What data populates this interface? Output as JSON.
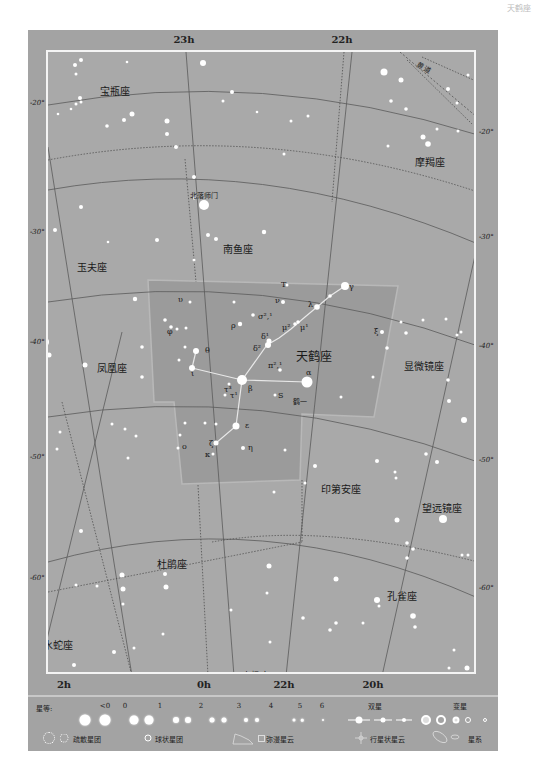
{
  "page_header": "天鹤座",
  "chart": {
    "ra_labels_top": [
      {
        "text": "23h",
        "x": 184
      },
      {
        "text": "22h",
        "x": 342
      }
    ],
    "ra_labels_bottom": [
      {
        "text": "2h",
        "x": 64
      },
      {
        "text": "0h",
        "x": 204
      },
      {
        "text": "22h",
        "x": 284
      },
      {
        "text": "20h",
        "x": 373
      }
    ],
    "dec_labels_left": [
      {
        "text": "-20°",
        "y": 104
      },
      {
        "text": "-30°",
        "y": 233
      },
      {
        "text": "-40°",
        "y": 343
      },
      {
        "text": "-50°",
        "y": 458
      },
      {
        "text": "-60°",
        "y": 579
      }
    ],
    "dec_labels_right": [
      {
        "text": "-20°",
        "y": 133
      },
      {
        "text": "-30°",
        "y": 238
      },
      {
        "text": "-40°",
        "y": 347
      },
      {
        "text": "-50°",
        "y": 461
      },
      {
        "text": "-60°",
        "y": 589
      }
    ],
    "constellations": [
      {
        "name": "宝瓶座",
        "x": 113,
        "y": 86,
        "size": 10
      },
      {
        "name": "摩羯座",
        "x": 428,
        "y": 157,
        "size": 10
      },
      {
        "name": "南鱼座",
        "x": 236,
        "y": 244,
        "size": 10
      },
      {
        "name": "玉夫座",
        "x": 90,
        "y": 262,
        "size": 10
      },
      {
        "name": "天鹤座",
        "x": 312,
        "y": 351,
        "size": 12
      },
      {
        "name": "凤凰座",
        "x": 110,
        "y": 363,
        "size": 10
      },
      {
        "name": "显微镜座",
        "x": 422,
        "y": 361,
        "size": 10
      },
      {
        "name": "印第安座",
        "x": 339,
        "y": 484,
        "size": 10
      },
      {
        "name": "望远镜座",
        "x": 440,
        "y": 503,
        "size": 10
      },
      {
        "name": "杜鹃座",
        "x": 170,
        "y": 559,
        "size": 10
      },
      {
        "name": "孔雀座",
        "x": 400,
        "y": 591,
        "size": 10
      },
      {
        "name": "水蛇座",
        "x": 56,
        "y": 640,
        "size": 10
      },
      {
        "name": "南极座",
        "x": 253,
        "y": 671,
        "size": 9
      }
    ],
    "annotations": [
      {
        "text": "黄道",
        "x": 422,
        "y": 64,
        "rotate": 30
      },
      {
        "text": "北落师门",
        "x": 202,
        "y": 192,
        "rotate": 0
      },
      {
        "text": "鹤一",
        "x": 298,
        "y": 398,
        "rotate": 0
      }
    ],
    "star_labels": [
      {
        "text": "T",
        "x": 279,
        "y": 283
      },
      {
        "text": "υ",
        "x": 176,
        "y": 298
      },
      {
        "text": "ν",
        "x": 273,
        "y": 299
      },
      {
        "text": "γ",
        "x": 347,
        "y": 285
      },
      {
        "text": "λ",
        "x": 306,
        "y": 303
      },
      {
        "text": "σ²,¹",
        "x": 256,
        "y": 315
      },
      {
        "text": "φ",
        "x": 165,
        "y": 330
      },
      {
        "text": "ρ",
        "x": 229,
        "y": 324
      },
      {
        "text": "μ²",
        "x": 280,
        "y": 326
      },
      {
        "text": "μ¹",
        "x": 298,
        "y": 326
      },
      {
        "text": "ξ",
        "x": 372,
        "y": 330
      },
      {
        "text": "δ¹",
        "x": 259,
        "y": 335
      },
      {
        "text": "δ²",
        "x": 251,
        "y": 347
      },
      {
        "text": "θ",
        "x": 203,
        "y": 349
      },
      {
        "text": "π²,¹",
        "x": 266,
        "y": 364
      },
      {
        "text": "ι",
        "x": 189,
        "y": 372
      },
      {
        "text": "α",
        "x": 304,
        "y": 371
      },
      {
        "text": "β",
        "x": 246,
        "y": 387
      },
      {
        "text": "τ³",
        "x": 222,
        "y": 388
      },
      {
        "text": "τ¹",
        "x": 228,
        "y": 394
      },
      {
        "text": "S",
        "x": 276,
        "y": 394
      },
      {
        "text": "ε",
        "x": 243,
        "y": 424
      },
      {
        "text": "ζ",
        "x": 207,
        "y": 442
      },
      {
        "text": "ο",
        "x": 180,
        "y": 445
      },
      {
        "text": "η",
        "x": 246,
        "y": 446
      },
      {
        "text": "κ",
        "x": 203,
        "y": 453
      }
    ]
  },
  "legend": {
    "magnitude_label": "星等:",
    "magnitudes": [
      {
        "label": "<0",
        "x": 105
      },
      {
        "label": "0",
        "x": 125
      },
      {
        "label": "1",
        "x": 160
      },
      {
        "label": "2",
        "x": 201
      },
      {
        "label": "3",
        "x": 239
      },
      {
        "label": "4",
        "x": 271
      },
      {
        "label": "5",
        "x": 300
      },
      {
        "label": "6",
        "x": 322
      }
    ],
    "double_star_label": "双星",
    "variable_star_label": "变星",
    "open_cluster_label": "疏散星团",
    "globular_cluster_label": "球状星团",
    "diffuse_nebula_label": "弥漫星云",
    "planetary_nebula_label": "行星状星云",
    "galaxy_label": "星系"
  },
  "colors": {
    "frame": "#a3a3a3",
    "chart_bg": "#a9a9a9",
    "grus_region": "#9a9a9a",
    "grid_line": "#555555",
    "star": "#ffffff"
  }
}
